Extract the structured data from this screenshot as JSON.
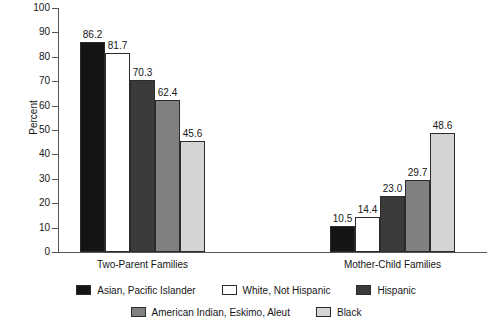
{
  "chart_data": {
    "type": "bar",
    "title": "",
    "xlabel": "",
    "ylabel": "Percent",
    "ylim": [
      0,
      100
    ],
    "ytick_step": 10,
    "yticks": [
      "100",
      "90",
      "80",
      "70",
      "60",
      "50",
      "40",
      "30",
      "20",
      "10",
      "0"
    ],
    "grid": false,
    "legend_position": "bottom",
    "categories": [
      "Two-Parent Families",
      "Mother-Child Families"
    ],
    "series": [
      {
        "name": "Asian, Pacific Islander",
        "color": "#141414",
        "values": [
          86.2,
          10.5
        ],
        "labels": [
          "86.2",
          "10.5"
        ]
      },
      {
        "name": "White, Not Hispanic",
        "color": "#ffffff",
        "values": [
          81.7,
          14.4
        ],
        "labels": [
          "81.7",
          "14.4"
        ]
      },
      {
        "name": "Hispanic",
        "color": "#3b3b3b",
        "values": [
          70.3,
          23.0
        ],
        "labels": [
          "70.3",
          "23.0"
        ]
      },
      {
        "name": "American Indian, Eskimo, Aleut",
        "color": "#808080",
        "values": [
          62.4,
          29.7
        ],
        "labels": [
          "62.4",
          "29.7"
        ]
      },
      {
        "name": "Black",
        "color": "#d4d4d4",
        "values": [
          45.6,
          48.6
        ],
        "labels": [
          "45.6",
          "48.6"
        ]
      }
    ]
  }
}
